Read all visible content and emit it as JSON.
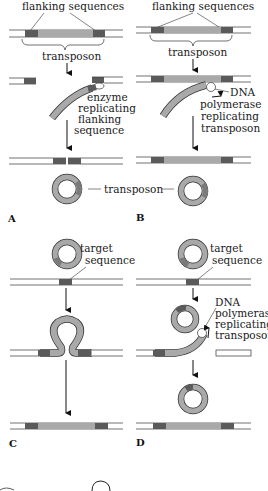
{
  "colors": {
    "transposon": "#a9a9a9",
    "flanking": "#5a5a5a",
    "strand": "#333333",
    "background": "#ffffff"
  },
  "panels": {
    "A": {
      "letter": "A",
      "header": "flanking sequences",
      "transposon_label": "transposon",
      "enzyme_label": [
        "enzyme",
        "replicating",
        "flanking",
        "sequence"
      ]
    },
    "B": {
      "letter": "B",
      "header": "flanking sequences",
      "polymerase_label": [
        "DNA",
        "polymerase",
        "replicating",
        "transposon"
      ]
    },
    "shared": {
      "circle_label": "transposon"
    },
    "C": {
      "letter": "C",
      "target_label": [
        "target",
        "sequence"
      ]
    },
    "D": {
      "letter": "D",
      "target_label": [
        "target",
        "sequence"
      ],
      "polymerase_label": [
        "DNA",
        "polymerase",
        "replicating",
        "transposon"
      ]
    }
  }
}
